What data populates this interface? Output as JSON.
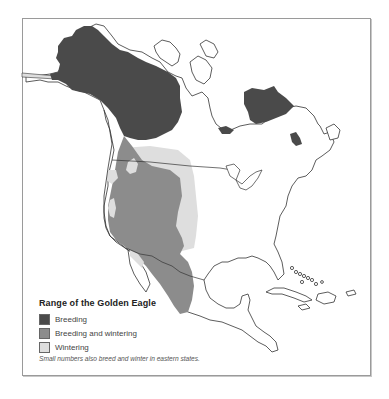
{
  "map": {
    "subject": "Range of the Golden Eagle",
    "region": "North America",
    "colors": {
      "breeding": "#4a4a4a",
      "breeding_and_wintering": "#8c8c8c",
      "wintering": "#dedede",
      "land_outline": "#333333",
      "frame_border": "#9a9a9a"
    }
  },
  "legend": {
    "title": "Range of the Golden Eagle",
    "items": [
      {
        "label": "Breeding",
        "color": "#4a4a4a"
      },
      {
        "label": "Breeding and wintering",
        "color": "#8c8c8c"
      },
      {
        "label": "Wintering",
        "color": "#dedede"
      }
    ],
    "footnote": "Small numbers also breed and winter in eastern states."
  }
}
